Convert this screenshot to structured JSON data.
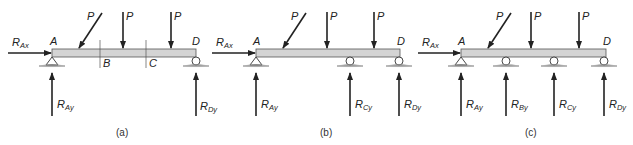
{
  "diagram": {
    "colors": {
      "beam_fill": "#d4d4d4",
      "beam_stroke": "#555555",
      "arrow": "#222222",
      "ground": "#888888"
    },
    "panels": [
      {
        "caption": "(a)",
        "points": [
          "A",
          "B",
          "C",
          "D"
        ],
        "loads": [
          "P",
          "P",
          "P"
        ],
        "reactions": {
          "horizontal": {
            "R": "R",
            "sub": "Ax"
          },
          "vertical": [
            {
              "R": "R",
              "sub": "Ay",
              "support": "pin"
            },
            {
              "R": "R",
              "sub": "Dy",
              "support": "roller"
            }
          ]
        }
      },
      {
        "caption": "(b)",
        "points": [
          "A",
          "D"
        ],
        "loads": [
          "P",
          "P",
          "P"
        ],
        "reactions": {
          "horizontal": {
            "R": "R",
            "sub": "Ax"
          },
          "vertical": [
            {
              "R": "R",
              "sub": "Ay",
              "support": "pin"
            },
            {
              "R": "R",
              "sub": "Cy",
              "support": "roller"
            },
            {
              "R": "R",
              "sub": "Dy",
              "support": "roller"
            }
          ]
        }
      },
      {
        "caption": "(c)",
        "points": [
          "A",
          "D"
        ],
        "loads": [
          "P",
          "P",
          "P"
        ],
        "reactions": {
          "horizontal": {
            "R": "R",
            "sub": "Ax"
          },
          "vertical": [
            {
              "R": "R",
              "sub": "Ay",
              "support": "pin"
            },
            {
              "R": "R",
              "sub": "By",
              "support": "roller"
            },
            {
              "R": "R",
              "sub": "Cy",
              "support": "roller"
            },
            {
              "R": "R",
              "sub": "Dy",
              "support": "roller"
            }
          ]
        }
      }
    ]
  }
}
